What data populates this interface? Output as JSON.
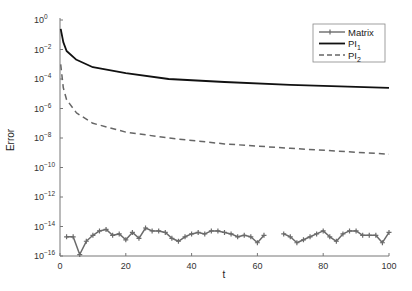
{
  "chart_data": {
    "type": "line",
    "title": "",
    "xlabel": "t",
    "ylabel": "Error",
    "xlim": [
      0,
      100
    ],
    "ylim_log10": [
      -16,
      0
    ],
    "yscale": "log",
    "grid": false,
    "legend_position": "upper right",
    "x_ticks": [
      0,
      20,
      40,
      60,
      80,
      100
    ],
    "y_ticks_log10": [
      0,
      -2,
      -4,
      -6,
      -8,
      -10,
      -12,
      -14,
      -16
    ],
    "y_tick_labels": [
      "10^0",
      "10^-2",
      "10^-4",
      "10^-6",
      "10^-8",
      "10^-10",
      "10^-12",
      "10^-14",
      "10^-16"
    ],
    "series": [
      {
        "name": "Matrix",
        "style": "solid-with-plus-markers",
        "color": "#6b6b6b",
        "x": [
          2,
          4,
          6,
          8,
          10,
          12,
          14,
          16,
          18,
          20,
          22,
          24,
          26,
          28,
          30,
          32,
          34,
          36,
          38,
          40,
          42,
          44,
          46,
          48,
          50,
          52,
          54,
          56,
          58,
          60,
          62,
          64,
          66,
          68,
          70,
          72,
          74,
          76,
          78,
          80,
          82,
          84,
          86,
          88,
          90,
          92,
          94,
          96,
          98,
          100
        ],
        "log10_values": [
          -14.7,
          -14.7,
          -15.9,
          -15.0,
          -14.6,
          -14.3,
          -14.2,
          -14.6,
          -14.5,
          -14.9,
          -14.4,
          -14.8,
          -14.1,
          -14.3,
          -14.3,
          -14.4,
          -14.8,
          -15.0,
          -14.7,
          -14.5,
          -14.4,
          -14.5,
          -14.3,
          -14.3,
          -14.4,
          -14.5,
          -14.7,
          -14.6,
          -14.7,
          -15.1,
          -14.6,
          null,
          null,
          -14.5,
          -14.7,
          -15.1,
          -14.9,
          -14.7,
          -14.5,
          -14.3,
          -14.7,
          -15.0,
          -14.5,
          -14.3,
          -14.3,
          -14.6,
          -14.6,
          -14.6,
          -15.1,
          -14.4
        ]
      },
      {
        "name": "PI_1",
        "legend_label": "PI",
        "legend_subscript": "1",
        "style": "solid",
        "color": "#111111",
        "x": [
          0.2,
          1,
          2,
          5,
          10,
          20,
          33,
          50,
          70,
          100
        ],
        "log10_values": [
          -0.6,
          -1.5,
          -2.1,
          -2.7,
          -3.2,
          -3.6,
          -4.0,
          -4.2,
          -4.4,
          -4.6
        ]
      },
      {
        "name": "PI_2",
        "legend_label": "PI",
        "legend_subscript": "2",
        "style": "dashed",
        "color": "#666666",
        "x": [
          0.2,
          1,
          2,
          5,
          10,
          20,
          33,
          50,
          70,
          100
        ],
        "log10_values": [
          -3.0,
          -4.6,
          -5.4,
          -6.3,
          -7.0,
          -7.6,
          -8.0,
          -8.4,
          -8.7,
          -9.1
        ]
      }
    ]
  },
  "legend": {
    "items": [
      {
        "label": "Matrix",
        "sub": ""
      },
      {
        "label": "PI",
        "sub": "1"
      },
      {
        "label": "PI",
        "sub": "2"
      }
    ]
  },
  "axes": {
    "xlabel": "t",
    "ylabel": "Error",
    "x_tick_labels": [
      "0",
      "20",
      "40",
      "60",
      "80",
      "100"
    ],
    "y_tick_exponents": [
      "0",
      "−2",
      "−4",
      "−6",
      "−8",
      "−10",
      "−12",
      "−14",
      "−16"
    ]
  }
}
